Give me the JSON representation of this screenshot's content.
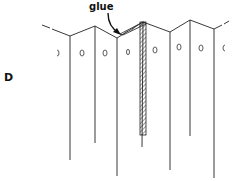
{
  "figure": {
    "panel_label": "D",
    "callout_label": "glue",
    "line_color": "#222222",
    "hatch_color": "#333333",
    "background": "#ffffff"
  },
  "diagram": {
    "fold_top_points": [
      [
        42,
        25
      ],
      [
        70,
        36
      ],
      [
        95,
        26
      ],
      [
        117,
        38
      ],
      [
        143,
        22
      ],
      [
        170,
        32
      ],
      [
        190,
        20
      ],
      [
        214,
        29
      ],
      [
        228,
        22
      ]
    ],
    "vertical_folds": [
      {
        "x": 70,
        "y_top": 36,
        "y_bottom": 160
      },
      {
        "x": 95,
        "y_top": 26,
        "y_bottom": 143
      },
      {
        "x": 117,
        "y_top": 38,
        "y_bottom": 176
      },
      {
        "x": 143,
        "y_top": 22,
        "y_bottom": 147
      },
      {
        "x": 170,
        "y_top": 32,
        "y_bottom": 170
      },
      {
        "x": 190,
        "y_top": 20,
        "y_bottom": 136
      },
      {
        "x": 214,
        "y_top": 29,
        "y_bottom": 178
      }
    ],
    "holes_x": [
      58,
      82,
      105,
      128,
      155,
      180,
      201,
      223
    ],
    "holes_y": 52,
    "glue_tab": {
      "x_left": 140,
      "x_right": 146,
      "y_top": 22,
      "y_bottom": 135
    }
  }
}
